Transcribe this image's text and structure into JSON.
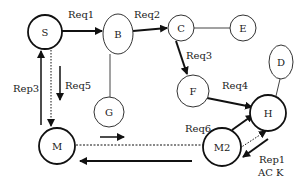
{
  "nodes": [
    {
      "id": "S",
      "label": "S"
    },
    {
      "id": "B",
      "label": "B"
    },
    {
      "id": "C",
      "label": "C"
    },
    {
      "id": "E",
      "label": "E"
    },
    {
      "id": "D",
      "label": "D"
    },
    {
      "id": "F",
      "label": "F"
    },
    {
      "id": "G",
      "label": "G"
    },
    {
      "id": "H",
      "label": "H"
    },
    {
      "id": "M",
      "label": "M"
    },
    {
      "id": "M2",
      "label": "M2"
    }
  ],
  "edges": [
    {
      "from": "S",
      "to": "B",
      "label": "Req1",
      "style": "solid-arrow"
    },
    {
      "from": "B",
      "to": "C",
      "label": "Req2",
      "style": "solid-arrow"
    },
    {
      "from": "C",
      "to": "F",
      "label": "Req3",
      "style": "solid-arrow"
    },
    {
      "from": "F",
      "to": "H",
      "label": "Req4",
      "style": "solid-arrow"
    },
    {
      "from": "S",
      "to": "M",
      "label": "Req5",
      "style": "solid-arrow-parallel"
    },
    {
      "from": "M2",
      "to": "H",
      "label": "Req6",
      "style": "solid-arrow"
    },
    {
      "from": "M",
      "to": "S",
      "label": "Rep3",
      "style": "solid-arrow"
    },
    {
      "from": "H",
      "to": "M2",
      "label": "Rep1",
      "style": "solid-arrow-parallel"
    },
    {
      "from": "M2",
      "to": "M",
      "label": "",
      "style": "solid-arrow-parallel"
    },
    {
      "from": "M",
      "to": "M2",
      "label": "",
      "style": "dotted"
    },
    {
      "from": "S",
      "to": "M",
      "label": "",
      "style": "dotted-arrow"
    },
    {
      "from": "M2",
      "to": "H",
      "label": "",
      "style": "dotted-arrow"
    },
    {
      "from": "C",
      "to": "E",
      "label": "",
      "style": "line"
    },
    {
      "from": "B",
      "to": "G",
      "label": "",
      "style": "line"
    },
    {
      "from": "D",
      "to": "H",
      "label": "",
      "style": "line"
    }
  ],
  "labels": {
    "req1": "Req1",
    "req2": "Req2",
    "req3": "Req3",
    "req4": "Req4",
    "req5": "Req5",
    "req6": "Req6",
    "rep3": "Rep3",
    "rep1": "Rep1",
    "ack": "AC K"
  },
  "colors": {
    "stroke": "#111111",
    "background": "#ffffff"
  }
}
